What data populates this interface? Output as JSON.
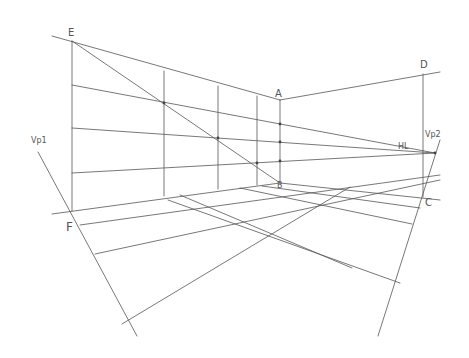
{
  "diagram": {
    "type": "two-point perspective construction",
    "stroke_color": "#555555",
    "background": "#ffffff",
    "labels": [
      {
        "id": "E",
        "text": "E",
        "x": 68,
        "y": 28,
        "size": "normal"
      },
      {
        "id": "A",
        "text": "A",
        "x": 275,
        "y": 89,
        "size": "normal"
      },
      {
        "id": "B",
        "text": "B",
        "x": 277,
        "y": 182,
        "size": "small"
      },
      {
        "id": "D",
        "text": "D",
        "x": 420,
        "y": 60,
        "size": "normal"
      },
      {
        "id": "C",
        "text": "C",
        "x": 425,
        "y": 198,
        "size": "normal"
      },
      {
        "id": "F",
        "text": "F",
        "x": 66,
        "y": 221,
        "size": "big"
      },
      {
        "id": "VP1",
        "text": "Vp1",
        "x": 31,
        "y": 137,
        "size": "small"
      },
      {
        "id": "VP2",
        "text": "Vp2",
        "x": 425,
        "y": 131,
        "size": "small"
      },
      {
        "id": "HL",
        "text": "HL",
        "x": 398,
        "y": 143,
        "size": "small"
      }
    ],
    "lines": [
      {
        "name": "left-wall-top-edge",
        "x1": 52,
        "y1": 36,
        "x2": 280,
        "y2": 100
      },
      {
        "name": "diagonal-E-to-B",
        "x1": 72,
        "y1": 41,
        "x2": 280,
        "y2": 183
      },
      {
        "name": "left-wall-row-1",
        "x1": 72,
        "y1": 85,
        "x2": 435,
        "y2": 153
      },
      {
        "name": "left-wall-row-2",
        "x1": 72,
        "y1": 128,
        "x2": 435,
        "y2": 153
      },
      {
        "name": "left-wall-row-3",
        "x1": 72,
        "y1": 173,
        "x2": 435,
        "y2": 153
      },
      {
        "name": "vertical-E-F",
        "x1": 72,
        "y1": 41,
        "x2": 72,
        "y2": 211
      },
      {
        "name": "vertical-col-1",
        "x1": 164,
        "y1": 71,
        "x2": 164,
        "y2": 196
      },
      {
        "name": "vertical-col-2",
        "x1": 218,
        "y1": 86,
        "x2": 218,
        "y2": 189
      },
      {
        "name": "vertical-col-3",
        "x1": 257,
        "y1": 96,
        "x2": 257,
        "y2": 185
      },
      {
        "name": "vertical-A-B",
        "x1": 280,
        "y1": 100,
        "x2": 280,
        "y2": 183
      },
      {
        "name": "right-wall-top-edge",
        "x1": 280,
        "y1": 100,
        "x2": 440,
        "y2": 72
      },
      {
        "name": "vertical-D-C",
        "x1": 423,
        "y1": 74,
        "x2": 423,
        "y2": 197
      },
      {
        "name": "floor-back-edge-left",
        "x1": 52,
        "y1": 214,
        "x2": 280,
        "y2": 183
      },
      {
        "name": "floor-back-edge-right",
        "x1": 280,
        "y1": 183,
        "x2": 440,
        "y2": 200
      },
      {
        "name": "floor-left-row-1",
        "x1": 80,
        "y1": 225,
        "x2": 440,
        "y2": 175
      },
      {
        "name": "floor-left-row-2",
        "x1": 95,
        "y1": 254,
        "x2": 440,
        "y2": 180
      },
      {
        "name": "floor-left-row-3",
        "x1": 122,
        "y1": 324,
        "x2": 350,
        "y2": 187
      },
      {
        "name": "floor-right-row-1",
        "x1": 262,
        "y1": 186,
        "x2": 420,
        "y2": 208
      },
      {
        "name": "floor-right-row-2",
        "x1": 240,
        "y1": 188,
        "x2": 412,
        "y2": 224
      },
      {
        "name": "floor-right-row-3",
        "x1": 180,
        "y1": 195,
        "x2": 352,
        "y2": 268
      },
      {
        "name": "floor-right-row-4",
        "x1": 168,
        "y1": 200,
        "x2": 400,
        "y2": 283
      },
      {
        "name": "vp1-measuring-line",
        "x1": 38,
        "y1": 152,
        "x2": 137,
        "y2": 336
      },
      {
        "name": "vp2-measuring-line",
        "x1": 440,
        "y1": 140,
        "x2": 378,
        "y2": 336
      }
    ],
    "points": [
      {
        "name": "diag-intersection-1",
        "x": 164,
        "y": 103
      },
      {
        "name": "diag-intersection-2",
        "x": 218,
        "y": 138
      },
      {
        "name": "diag-intersection-3",
        "x": 257,
        "y": 163
      },
      {
        "name": "ab-tick-1",
        "x": 280,
        "y": 124
      },
      {
        "name": "ab-tick-2",
        "x": 280,
        "y": 142
      },
      {
        "name": "ab-tick-3",
        "x": 280,
        "y": 161
      },
      {
        "name": "vp2-point",
        "x": 435,
        "y": 153
      }
    ]
  }
}
